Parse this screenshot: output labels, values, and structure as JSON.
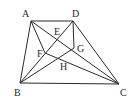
{
  "figure": {
    "type": "geometry-diagram",
    "points": {
      "A": {
        "x": 31,
        "y": 21,
        "label": "A",
        "lx": 22,
        "ly": 17
      },
      "D": {
        "x": 73,
        "y": 21,
        "label": "D",
        "lx": 72,
        "ly": 17
      },
      "B": {
        "x": 20,
        "y": 83,
        "label": "B",
        "lx": 14,
        "ly": 96
      },
      "C": {
        "x": 119,
        "y": 84,
        "label": "C",
        "lx": 120,
        "ly": 96
      },
      "E": {
        "x": 57,
        "y": 40,
        "label": "E",
        "lx": 54,
        "ly": 35
      },
      "F": {
        "x": 45,
        "y": 53,
        "label": "F",
        "lx": 37,
        "ly": 57
      },
      "G": {
        "x": 74,
        "y": 48,
        "label": "G",
        "lx": 77,
        "ly": 52
      },
      "H": {
        "x": 63,
        "y": 59,
        "label": "H",
        "lx": 60,
        "ly": 70
      }
    },
    "segments": [
      [
        "A",
        "D"
      ],
      [
        "A",
        "B"
      ],
      [
        "B",
        "C"
      ],
      [
        "D",
        "C"
      ],
      [
        "A",
        "C"
      ],
      [
        "B",
        "D"
      ],
      [
        "A",
        "F"
      ],
      [
        "D",
        "G"
      ],
      [
        "B",
        "G"
      ],
      [
        "F",
        "C"
      ]
    ],
    "labels": [
      "A",
      "B",
      "C",
      "D",
      "E",
      "F",
      "G",
      "H"
    ],
    "stroke_color": "#2a2a2a"
  }
}
